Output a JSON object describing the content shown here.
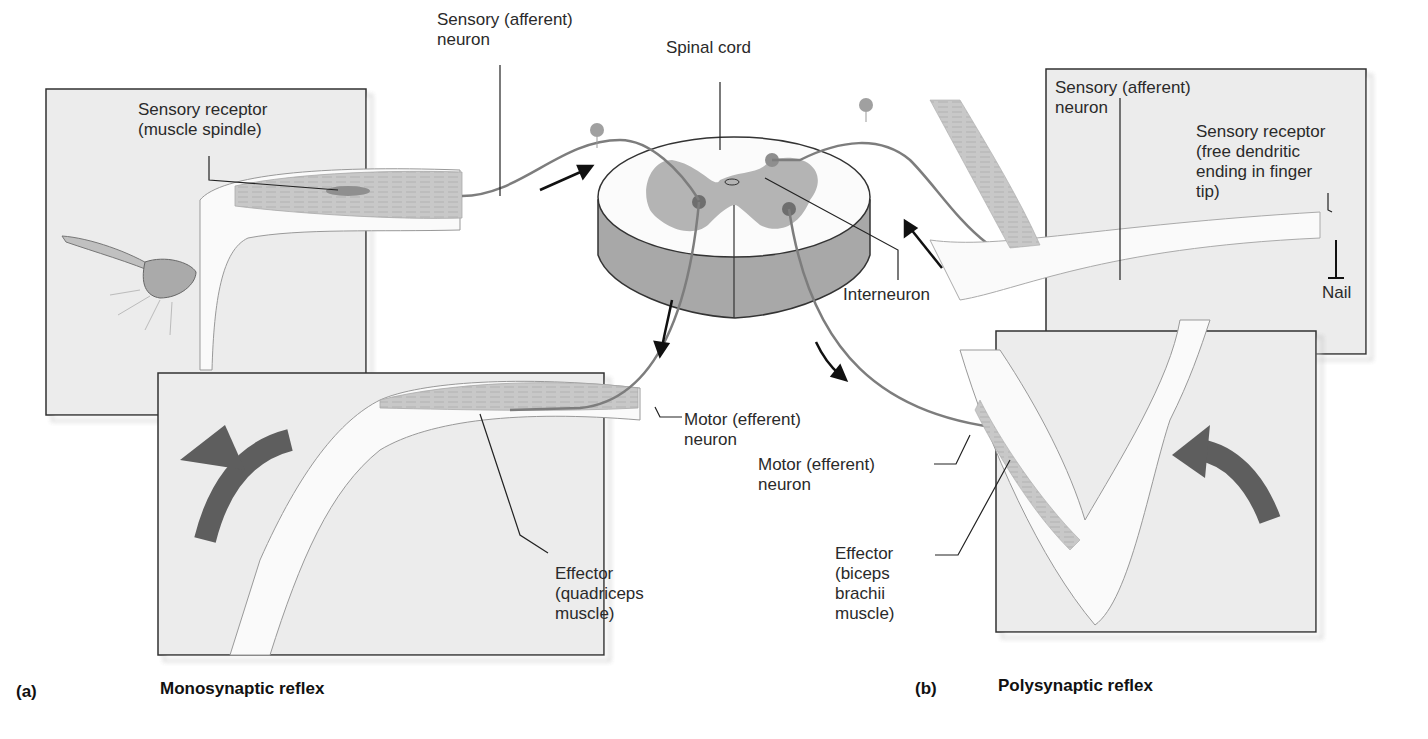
{
  "figure": {
    "panel_a": {
      "letter": "(a)",
      "title": "Monosynaptic reflex",
      "labels": {
        "sensory_neuron_1": "Sensory (afferent)",
        "sensory_neuron_2": "neuron",
        "receptor_1": "Sensory receptor",
        "receptor_2": "(muscle spindle)",
        "motor_1": "Motor (efferent)",
        "motor_2": "neuron",
        "effector_1": "Effector",
        "effector_2": "(quadriceps",
        "effector_3": "muscle)"
      }
    },
    "center": {
      "spinal_cord": "Spinal cord",
      "interneuron": "Interneuron"
    },
    "panel_b": {
      "letter": "(b)",
      "title": "Polysynaptic reflex",
      "labels": {
        "sensory_neuron_1": "Sensory (afferent)",
        "sensory_neuron_2": "neuron",
        "receptor_1": "Sensory receptor",
        "receptor_2": "(free dendritic",
        "receptor_3": "ending in finger",
        "receptor_4": "tip)",
        "nail": "Nail",
        "motor_1": "Motor (efferent)",
        "motor_2": "neuron",
        "effector_1": "Effector",
        "effector_2": "(biceps",
        "effector_3": "brachii",
        "effector_4": "muscle)"
      }
    },
    "colors": {
      "panel_bg": "#ececec",
      "gray_matter": "#b4b4b4",
      "cord_side": "#a8a8a8",
      "neuron": "#7d7d7d",
      "arrow": "#5e5e5e",
      "muscle": "#c6c6c6"
    }
  }
}
